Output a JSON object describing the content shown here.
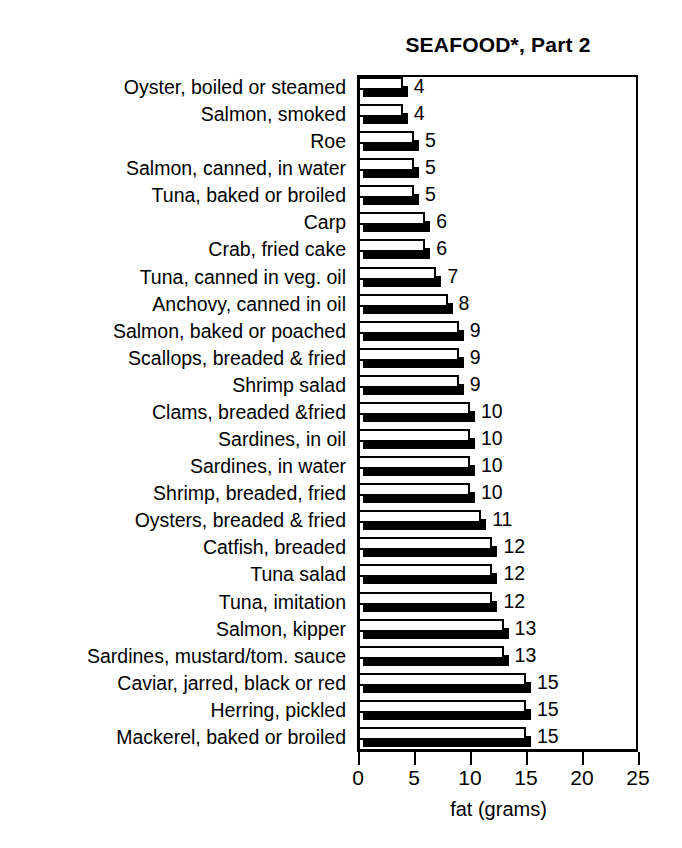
{
  "chart_data": {
    "type": "bar",
    "orientation": "horizontal",
    "title": "SEAFOOD*, Part 2",
    "xlabel": "fat (grams)",
    "ylabel": "",
    "xlim": [
      0,
      25
    ],
    "xticks": [
      0,
      5,
      10,
      15,
      20,
      25
    ],
    "xtick_labels": [
      "0",
      "5",
      "10",
      "15",
      "20",
      "25"
    ],
    "grid": false,
    "legend": null,
    "style": "3d-shadow-bars",
    "categories": [
      "Oyster, boiled or steamed",
      "Salmon, smoked",
      "Roe",
      "Salmon, canned, in water",
      "Tuna, baked or broiled",
      "Carp",
      "Crab, fried cake",
      "Tuna, canned in veg. oil",
      "Anchovy, canned in oil",
      "Salmon, baked or poached",
      "Scallops, breaded & fried",
      "Shrimp salad",
      "Clams, breaded &fried",
      "Sardines, in oil",
      "Sardines, in water",
      "Shrimp, breaded, fried",
      "Oysters, breaded & fried",
      "Catfish, breaded",
      "Tuna salad",
      "Tuna, imitation",
      "Salmon, kipper",
      "Sardines, mustard/tom. sauce",
      "Caviar, jarred, black or red",
      "Herring, pickled",
      "Mackerel, baked or broiled"
    ],
    "values": [
      4,
      4,
      5,
      5,
      5,
      6,
      6,
      7,
      8,
      9,
      9,
      9,
      10,
      10,
      10,
      10,
      11,
      12,
      12,
      12,
      13,
      13,
      15,
      15,
      15
    ],
    "value_labels": [
      "4",
      "4",
      "5",
      "5",
      "5",
      "6",
      "6",
      "7",
      "8",
      "9",
      "9",
      "9",
      "10",
      "10",
      "10",
      "10",
      "11",
      "12",
      "12",
      "12",
      "13",
      "13",
      "15",
      "15",
      "15"
    ],
    "colors": {
      "bar_face": "#ffffff",
      "bar_outline": "#000000",
      "bar_shadow": "#000000",
      "axis": "#000000",
      "text": "#000000",
      "background": "#ffffff"
    }
  }
}
